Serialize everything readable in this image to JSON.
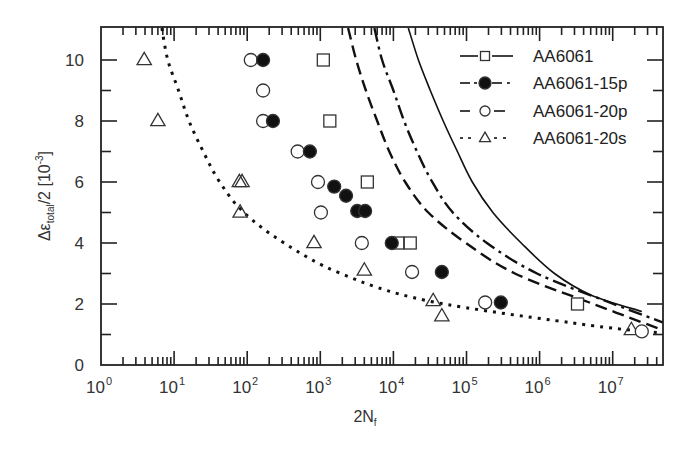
{
  "chart_data": {
    "type": "scatter",
    "title": "",
    "xlabel": "2N_f",
    "xlabel_main": "2N",
    "xlabel_sub": "f",
    "ylabel": "Δε_total/2 [10^-3]",
    "ylabel_parts": {
      "delta_eps": "Δε",
      "sub": "total",
      "rest": "/2  [10",
      "exp": "-3",
      "close": "]"
    },
    "x_scale": "log",
    "xlim": [
      1,
      48000000
    ],
    "ylim": [
      0,
      11.05
    ],
    "x_ticks": [
      {
        "base": "10",
        "exp": "0",
        "value": 1
      },
      {
        "base": "10",
        "exp": "1",
        "value": 10
      },
      {
        "base": "10",
        "exp": "2",
        "value": 100
      },
      {
        "base": "10",
        "exp": "3",
        "value": 1000
      },
      {
        "base": "10",
        "exp": "4",
        "value": 10000
      },
      {
        "base": "10",
        "exp": "5",
        "value": 100000
      },
      {
        "base": "10",
        "exp": "6",
        "value": 1000000
      },
      {
        "base": "10",
        "exp": "7",
        "value": 10000000
      }
    ],
    "y_ticks": [
      "0",
      "2",
      "4",
      "6",
      "8",
      "10"
    ],
    "grid": false,
    "legend_position": "upper right",
    "series": [
      {
        "name": "AA6061",
        "marker": "open-square",
        "line": "solid",
        "points": [
          [
            1100,
            10
          ],
          [
            1350,
            8
          ],
          [
            4400,
            6
          ],
          [
            11500,
            4
          ],
          [
            17000,
            4
          ],
          [
            3300000,
            2
          ]
        ],
        "fit_curve": [
          [
            16000,
            11.05
          ],
          [
            22000,
            10
          ],
          [
            32000,
            9
          ],
          [
            48000,
            8
          ],
          [
            75000,
            7
          ],
          [
            120000,
            6
          ],
          [
            230000,
            5
          ],
          [
            560000,
            4
          ],
          [
            1600000,
            3
          ],
          [
            5000000,
            2.3
          ],
          [
            25000000,
            1.75
          ]
        ]
      },
      {
        "name": "AA6061-15p",
        "marker": "filled-circle",
        "line": "dash-dot",
        "points": [
          [
            165,
            10
          ],
          [
            225,
            8
          ],
          [
            720,
            7
          ],
          [
            1550,
            5.85
          ],
          [
            2250,
            5.55
          ],
          [
            3200,
            5.05
          ],
          [
            4100,
            5.05
          ],
          [
            9500,
            4
          ],
          [
            46000,
            3.05
          ],
          [
            295000,
            2.05
          ]
        ],
        "fit_curve": [
          [
            5500,
            11.05
          ],
          [
            7000,
            10
          ],
          [
            10000,
            9
          ],
          [
            14000,
            8
          ],
          [
            21000,
            7
          ],
          [
            34000,
            6
          ],
          [
            65000,
            5
          ],
          [
            190000,
            4
          ],
          [
            920000,
            3
          ],
          [
            8000000,
            2.1
          ],
          [
            48000000,
            1.4
          ]
        ]
      },
      {
        "name": "AA6061-20p",
        "marker": "open-circle",
        "line": "dashed",
        "points": [
          [
            112,
            10
          ],
          [
            165,
            9
          ],
          [
            165,
            8
          ],
          [
            490,
            7
          ],
          [
            930,
            6
          ],
          [
            1020,
            5
          ],
          [
            3700,
            4
          ],
          [
            18000,
            3.05
          ],
          [
            180000,
            2.05
          ],
          [
            25000000,
            1.1
          ]
        ],
        "fit_curve": [
          [
            2400,
            11.05
          ],
          [
            3100,
            10
          ],
          [
            4200,
            9
          ],
          [
            6000,
            8
          ],
          [
            8800,
            7
          ],
          [
            14500,
            6
          ],
          [
            30000,
            5
          ],
          [
            98000,
            4
          ],
          [
            460000,
            3
          ],
          [
            4800000,
            2.05
          ],
          [
            48000000,
            1.15
          ]
        ]
      },
      {
        "name": "AA6061-20s",
        "marker": "open-triangle",
        "line": "dotted",
        "points": [
          [
            3.9,
            10
          ],
          [
            6,
            8
          ],
          [
            78,
            6
          ],
          [
            85,
            6
          ],
          [
            80,
            5
          ],
          [
            820,
            4
          ],
          [
            4000,
            3.1
          ],
          [
            35000,
            2.1
          ],
          [
            46000,
            1.6
          ],
          [
            18000000,
            1.15
          ]
        ],
        "fit_curve": [
          [
            6.8,
            11.05
          ],
          [
            8.2,
            10
          ],
          [
            11.5,
            9
          ],
          [
            16,
            8
          ],
          [
            25,
            7
          ],
          [
            42,
            6
          ],
          [
            90,
            5
          ],
          [
            320,
            4
          ],
          [
            1900,
            3
          ],
          [
            30000,
            2.1
          ],
          [
            5000000,
            1.3
          ],
          [
            48000000,
            1.05
          ]
        ]
      }
    ]
  },
  "legend": {
    "items": [
      {
        "label": "AA6061"
      },
      {
        "label": "AA6061-15p"
      },
      {
        "label": "AA6061-20p"
      },
      {
        "label": "AA6061-20s"
      }
    ]
  },
  "colors": {
    "axis": "#222222",
    "text": "#333333",
    "marker": "#111111",
    "background": "#ffffff"
  }
}
